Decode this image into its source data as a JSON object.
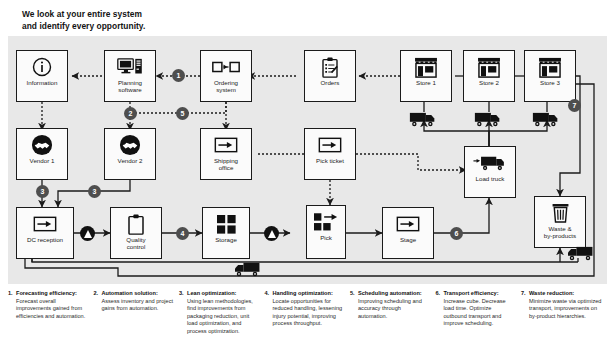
{
  "title": {
    "line1": "We look at your entire system",
    "line2": "and identify every opportunity."
  },
  "nodes": {
    "information": {
      "label": "Information",
      "icon": "information-icon"
    },
    "planning": {
      "label": "Planning\nsoftware",
      "icon": "computer-icon"
    },
    "ordering": {
      "label": "Ordering\nsystem",
      "icon": "transfer-boxes-icon"
    },
    "orders": {
      "label": "Orders",
      "icon": "clipboard-checklist-icon"
    },
    "store1": {
      "label": "Store 1",
      "icon": "storefront-icon"
    },
    "store2": {
      "label": "Store 2",
      "icon": "storefront-icon"
    },
    "store3": {
      "label": "Store 3",
      "icon": "storefront-icon"
    },
    "vendor1": {
      "label": "Vendor 1",
      "icon": "handshake-icon"
    },
    "vendor2": {
      "label": "Vendor 2",
      "icon": "handshake-icon"
    },
    "shipping": {
      "label": "Shipping\noffice",
      "icon": "document-arrow-icon"
    },
    "pickticket": {
      "label": "Pick ticket",
      "icon": "document-arrow-icon"
    },
    "loadtruck": {
      "label": "Load truck",
      "icon": "truck-load-icon"
    },
    "dcreception": {
      "label": "DC reception",
      "icon": "document-arrow-icon"
    },
    "quality": {
      "label": "Quality\ncontrol",
      "icon": "clipboard-icon"
    },
    "storage": {
      "label": "Storage",
      "icon": "grid-squares-icon"
    },
    "pick": {
      "label": "Pick",
      "icon": "pick-squares-arrow-icon"
    },
    "stage": {
      "label": "Stage",
      "icon": "document-arrow-icon"
    },
    "waste": {
      "label": "Waste &\nby-products",
      "icon": "trash-can-icon"
    }
  },
  "markers": {
    "numbers": [
      "1",
      "2",
      "3",
      "3",
      "4",
      "5",
      "6",
      "7"
    ],
    "warnings": [
      "warning-badge",
      "warning-badge"
    ]
  },
  "legend": [
    {
      "num": "1.",
      "head": "Forecasting efficiency:",
      "text": "Forecast overall improvements gained from efficiencies and automation."
    },
    {
      "num": "2.",
      "head": "Automation solution:",
      "text": "Assess inventory and project gains from automation."
    },
    {
      "num": "3.",
      "head": "Lean optimization:",
      "text": "Using lean methodologies, find improvements from packaging reduction, unit load optimization, and process optimization."
    },
    {
      "num": "4.",
      "head": "Handling optimization:",
      "text": "Locate opportunities for reduced handling, lessening injury potential, improving process throughput."
    },
    {
      "num": "5.",
      "head": "Scheduling automation:",
      "text": "Improving scheduling and accuracy through automation."
    },
    {
      "num": "6.",
      "head": "Transport efficiency:",
      "text": "Increase cube. Decrease load time. Optimize outbound transport and improve scheduling."
    },
    {
      "num": "7.",
      "head": "Waste reduction:",
      "text": "Minimize waste via optimized transport, improvements on by-product hierarchies."
    }
  ],
  "colors": {
    "panel_bg": "#e8e8e8",
    "node_bg": "#fbfbfb",
    "stroke": "#1b1b1b",
    "marker_fill": "#4e4e4e",
    "warning_fill": "#121212"
  }
}
